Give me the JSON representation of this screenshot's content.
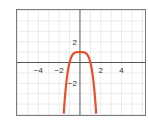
{
  "chart_data": {
    "type": "line",
    "title": "",
    "xlabel": "",
    "ylabel": "",
    "function": "y = 1 - x^4",
    "xlim": [
      -6.1,
      6.3
    ],
    "ylim": [
      -5.1,
      5.1
    ],
    "grid": true,
    "grid_step": 1,
    "x_ticks": [
      -4,
      -2,
      2,
      4
    ],
    "x_tick_labels": [
      "−4",
      "−2",
      "2",
      "4"
    ],
    "y_ticks": [
      2,
      -2
    ],
    "y_tick_labels": [
      "2",
      "−2"
    ],
    "series": [
      {
        "name": "curve",
        "color": "#e8502a",
        "x": [
          -1.55,
          -1.5,
          -1.4,
          -1.3,
          -1.2,
          -1.1,
          -1.0,
          -0.9,
          -0.8,
          -0.6,
          -0.4,
          -0.2,
          0,
          0.2,
          0.4,
          0.6,
          0.8,
          0.9,
          1.0,
          1.1,
          1.2,
          1.3,
          1.4,
          1.5,
          1.55
        ],
        "y": [
          -4.77,
          -4.06,
          -2.84,
          -1.86,
          -1.07,
          -0.46,
          0,
          0.34,
          0.59,
          0.87,
          0.97,
          1.0,
          1.0,
          1.0,
          0.97,
          0.87,
          0.59,
          0.34,
          0,
          -0.46,
          -1.07,
          -1.86,
          -2.84,
          -4.06,
          -4.77
        ]
      }
    ],
    "legend": null
  },
  "colors": {
    "frame": "#7a7a7a",
    "axis": "#555555",
    "grid": "#e6e6e6",
    "curve": "#e8502a"
  }
}
